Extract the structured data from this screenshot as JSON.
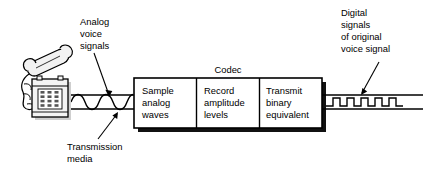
{
  "diagram": {
    "title_visible": false,
    "background_color": "#ffffff",
    "line_color": "#000000",
    "shadow_color": "#1a1a1a",
    "phone_fill": "#f2f2f2"
  },
  "annotations": {
    "analog": {
      "name": "analog-voice-signals-label",
      "lines": [
        "Analog",
        "voice",
        "signals"
      ]
    },
    "digital": {
      "name": "digital-signals-label",
      "lines": [
        "Digital",
        "signals",
        "of original",
        "voice signal"
      ]
    },
    "transmission": {
      "name": "transmission-media-label",
      "lines": [
        "Transmission",
        "media"
      ]
    }
  },
  "codec": {
    "title": "Codec",
    "cells": [
      {
        "id": "sample-analog-waves",
        "lines": [
          "Sample",
          "analog",
          "waves"
        ]
      },
      {
        "id": "record-amplitude-levels",
        "lines": [
          "Record",
          "amplitude",
          "levels"
        ]
      },
      {
        "id": "transmit-binary-equivalent",
        "lines": [
          "Transmit",
          "binary",
          "equivalent"
        ]
      }
    ]
  },
  "signals": {
    "analog_wave": {
      "name": "analog-sine-wave",
      "cycles": 3.5,
      "amplitude": 5
    },
    "digital_wave": {
      "name": "digital-square-wave",
      "pulses": 5,
      "amplitude": 9
    }
  },
  "device": {
    "name": "desk-telephone",
    "keypad_rows": 4,
    "keypad_cols": 3
  }
}
